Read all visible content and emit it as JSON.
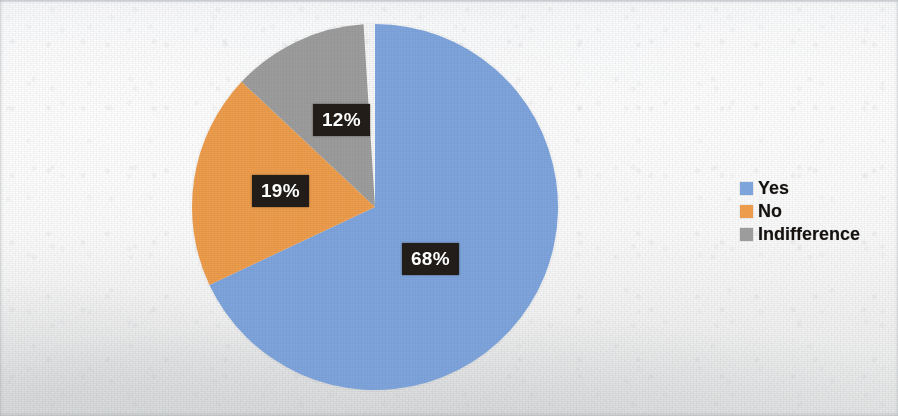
{
  "chart_data": {
    "type": "pie",
    "title": "",
    "subtitle": "",
    "xlabel": "",
    "ylabel": "",
    "grid": false,
    "legend_position": "right",
    "start_angle_deg": 0,
    "direction": "clockwise",
    "categories": [
      "Yes",
      "No",
      "Indifference"
    ],
    "values": [
      68,
      19,
      12
    ],
    "value_unit": "%",
    "labels": [
      "68%",
      "19%",
      "12%"
    ],
    "colors": [
      "#7ea4dc",
      "#ed9c4c",
      "#9c9c9c"
    ],
    "slices": [
      {
        "name": "Yes",
        "value": 68,
        "label": "68%",
        "color": "#7ea4dc",
        "start_deg": 0,
        "sweep_deg": 244.8
      },
      {
        "name": "No",
        "value": 19,
        "label": "19%",
        "color": "#ed9c4c",
        "start_deg": 244.8,
        "sweep_deg": 68.4
      },
      {
        "name": "Indifference",
        "value": 12,
        "label": "12%",
        "color": "#9c9c9c",
        "start_deg": 313.2,
        "sweep_deg": 43.2
      }
    ]
  },
  "pie": {
    "label_yes": "68%",
    "label_no": "19%",
    "label_indifference": "12%"
  },
  "legend": {
    "items": [
      {
        "label": "Yes",
        "color": "#7ea4dc"
      },
      {
        "label": "No",
        "color": "#ed9c4c"
      },
      {
        "label": "Indifference",
        "color": "#9c9c9c"
      }
    ]
  },
  "colors": {
    "series_yes": "#7ea4dc",
    "series_no": "#ed9c4c",
    "series_indifference": "#9c9c9c",
    "label_background": "#231d19",
    "label_text": "#ffffff",
    "legend_text": "#15110f",
    "page_background": "#fafbfb"
  }
}
